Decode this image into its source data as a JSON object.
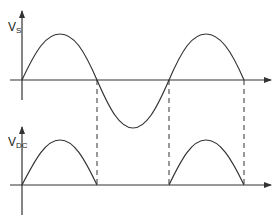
{
  "diagram": {
    "colors": {
      "stroke": "#333333",
      "background": "#ffffff"
    },
    "top_plot": {
      "y_label_main": "V",
      "y_label_sub": "S",
      "signal": "full sine wave (input AC voltage)"
    },
    "bottom_plot": {
      "y_label_main": "V",
      "y_label_sub": "DC",
      "signal": "positive half-cycles only (rectified output)"
    },
    "guides": "dashed vertical lines at zero crossings"
  }
}
